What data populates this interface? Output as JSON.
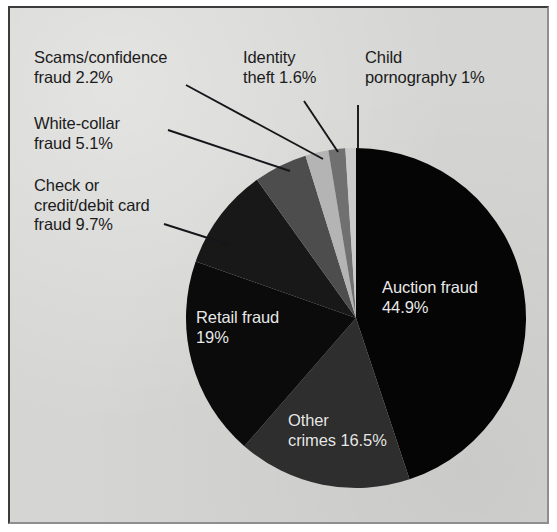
{
  "figure": {
    "background_color": "#d5d5d3",
    "frame_border_color": "#3c3c3c"
  },
  "chart_data": {
    "type": "pie",
    "title": "",
    "subtitle": "",
    "xlabel": "",
    "ylabel": "",
    "legend_position": "none",
    "grid": false,
    "start_angle_deg": 0,
    "direction": "clockwise",
    "center": {
      "x": 356,
      "y": 318
    },
    "radius": 170,
    "categories": [
      "Auction fraud",
      "Other crimes",
      "Retail fraud",
      "Check or credit/debit card fraud",
      "White-collar fraud",
      "Scams/confidence fraud",
      "Identity theft",
      "Child pornography"
    ],
    "values": [
      44.9,
      16.5,
      19,
      9.7,
      5.1,
      2.2,
      1.6,
      1
    ],
    "value_labels": [
      "44.9%",
      "16.5%",
      "19%",
      "9.7%",
      "5.1%",
      "2.2%",
      "1.6%",
      "1%"
    ],
    "colors": [
      "#050505",
      "#2e2e2e",
      "#0b0b0b",
      "#181818",
      "#4d4d4d",
      "#b4b4b4",
      "#707070",
      "#cbcbcb"
    ],
    "units": "percent"
  },
  "slice_labels": [
    {
      "name": "auction",
      "line1": "Auction fraud",
      "line2": "44.9%",
      "text": "Auction fraud\n44.9%"
    },
    {
      "name": "retail",
      "line1": "Retail fraud",
      "line2": "19%",
      "text": "Retail fraud\n19%"
    },
    {
      "name": "other",
      "line1": "Other",
      "line2": "crimes 16.5%",
      "text": "Other\ncrimes 16.5%"
    }
  ],
  "callouts": [
    {
      "name": "scams",
      "text": "Scams/confidence\nfraud 2.2%"
    },
    {
      "name": "white-collar",
      "text": "White-collar\nfraud 5.1%"
    },
    {
      "name": "check-credit-debit",
      "text": "Check or\ncredit/debit card\nfraud 9.7%"
    },
    {
      "name": "identity-theft",
      "text": "Identity\ntheft 1.6%"
    },
    {
      "name": "child-pornography",
      "text": "Child\npornography 1%"
    }
  ]
}
